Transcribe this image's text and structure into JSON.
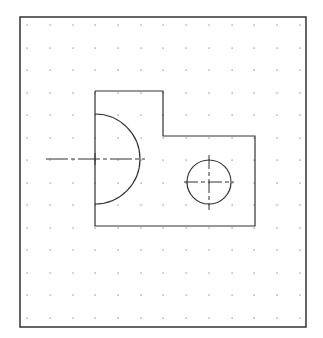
{
  "drawing": {
    "background": "#ffffff",
    "line_color": "#333333",
    "grid_color": "#888888",
    "frame": {
      "x": 20,
      "y": 17,
      "width": 286,
      "height": 310
    },
    "grid": {
      "x_positions": [
        27,
        50,
        73,
        95,
        118,
        141,
        163,
        186,
        209,
        232,
        254,
        277,
        300
      ],
      "y_positions": [
        25,
        48,
        70,
        93,
        115,
        138,
        160,
        183,
        205,
        228,
        250,
        273,
        295,
        318
      ]
    },
    "outline": {
      "points": [
        [
          95,
          91
        ],
        [
          163,
          91
        ],
        [
          163,
          136
        ],
        [
          255,
          136
        ],
        [
          255,
          226
        ],
        [
          95,
          226
        ],
        [
          95,
          91
        ]
      ]
    },
    "semicircle": {
      "cx": 95,
      "cy": 159,
      "r": 45
    },
    "left_centerline": {
      "x1": 46,
      "x2": 145,
      "y": 159
    },
    "left_center_cross": {
      "cx": 95,
      "cy": 159,
      "half": 6
    },
    "hole": {
      "cx": 209,
      "cy": 182,
      "r": 22
    },
    "hole_centerlines": {
      "h_x1": 184,
      "h_x2": 234,
      "v_y1": 155,
      "v_y2": 210
    }
  }
}
